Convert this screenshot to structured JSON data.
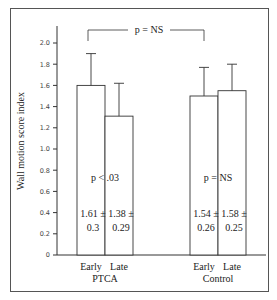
{
  "chart_data": {
    "type": "bar",
    "title": "",
    "xlabel": "",
    "ylabel": "Wall motion score index",
    "ylim": [
      0,
      2.0
    ],
    "yticks": [
      "0",
      "0.2",
      "0.4",
      "0.6",
      "0.8",
      "1.0",
      "1.2",
      "1.4",
      "1.6",
      "1.8",
      "2.0"
    ],
    "grid": false,
    "groups": [
      {
        "name": "PTCA",
        "categories": [
          "Early",
          "Late"
        ],
        "values": [
          1.6,
          1.31
        ],
        "error_upper": [
          1.9,
          1.62
        ],
        "labels": [
          {
            "mean": "1.61 ±",
            "sd": "0.3"
          },
          {
            "mean": "1.38 ±",
            "sd": "0.29"
          }
        ],
        "annotation": "p < .03"
      },
      {
        "name": "Control",
        "categories": [
          "Early",
          "Late"
        ],
        "values": [
          1.5,
          1.55
        ],
        "error_upper": [
          1.77,
          1.8
        ],
        "labels": [
          {
            "mean": "1.54 ±",
            "sd": "0.26"
          },
          {
            "mean": "1.58 ±",
            "sd": "0.25"
          }
        ],
        "annotation": "p = NS"
      }
    ],
    "between_group_annotation": "p = NS"
  }
}
